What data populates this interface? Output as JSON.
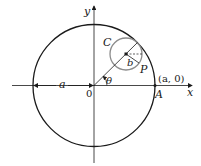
{
  "diagram": {
    "labels": {
      "y_axis": "y",
      "x_axis": "x",
      "origin": "0",
      "radius_a": "a",
      "small_circle": "C",
      "small_radius": "b",
      "point_p": "P",
      "point_a": "A",
      "point_a_coords": "(a, 0)",
      "angle": "θ"
    },
    "colors": {
      "stroke": "#1a1a1a",
      "small_circle": "#8c8c8c",
      "background": "#ffffff"
    }
  }
}
